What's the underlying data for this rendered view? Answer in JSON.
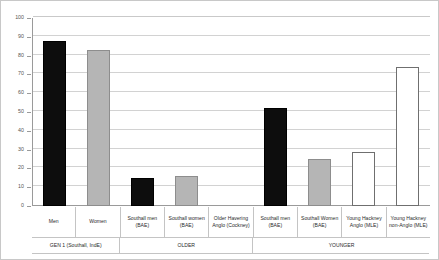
{
  "chart_data": {
    "type": "bar",
    "title": "",
    "subtitle": "",
    "xlabel": "",
    "ylabel": "",
    "ylim": [
      0,
      100
    ],
    "ytick_step": 10,
    "yticks": [
      0,
      10,
      20,
      30,
      40,
      50,
      60,
      70,
      80,
      90,
      100
    ],
    "ytick_labels": [
      "0",
      "10",
      "20",
      "30",
      "40",
      "50",
      "60",
      "70",
      "80",
      "90",
      "100"
    ],
    "grid": true,
    "grid_axis": "y",
    "legend": false,
    "legend_position": "none",
    "categories": [
      "Men",
      "Women",
      "Southall men (BAE)",
      "Southall women (BAE)",
      "Older Havering Anglo (Cockney)",
      "Southall men (BAE)",
      "Southall Women (BAE)",
      "Young Hackney Anglo (MLE)",
      "Young Hackney non-Anglo (MLE)"
    ],
    "category_lines": [
      [
        "Men"
      ],
      [
        "Women"
      ],
      [
        "Southall men",
        "(BAE)"
      ],
      [
        "Southall women",
        "(BAE)"
      ],
      [
        "Older Havering",
        "Anglo (Cockney)"
      ],
      [
        "Southall men",
        "(BAE)"
      ],
      [
        "Southall Women",
        "(BAE)"
      ],
      [
        "Young Hackney",
        "Anglo (MLE)"
      ],
      [
        "Young Hackney",
        "non-Anglo (MLE)"
      ]
    ],
    "values": [
      88,
      83,
      15,
      16,
      0,
      52,
      25,
      28.5,
      74
    ],
    "bar_styles": [
      "black",
      "grey",
      "black",
      "grey",
      "white",
      "black",
      "grey",
      "white",
      "white"
    ],
    "colors": {
      "black": "#0d0d0d",
      "grey": "#b5b5b5",
      "white": "#ffffff",
      "gridline": "#d2d2d2",
      "axis": "#9a9a9a",
      "frame": "#c8c8c8",
      "text": "#2b2b2b"
    },
    "groups": [
      {
        "label": "GEN 1 (Southall, IndE)",
        "span": 2
      },
      {
        "label": "OLDER",
        "span": 3
      },
      {
        "label": "YOUNGER",
        "span": 4
      }
    ]
  }
}
